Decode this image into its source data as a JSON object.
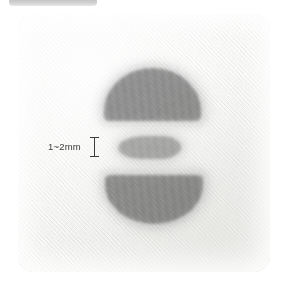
{
  "top_bar": {
    "name": "partial-rounded-bar",
    "color": "#bdbdbd"
  },
  "photo": {
    "name": "fabric-closeup-photo",
    "background_color": "#f7f7f6",
    "material": "white-twill-fabric",
    "corner_radius_px": 16
  },
  "annotation": {
    "label": "1~2mm",
    "marker": "i-beam-caliper",
    "text_color": "#3a3a3a",
    "marker_color": "#3d3d3d"
  },
  "marks": [
    {
      "id": "mark-top",
      "shape": "dome",
      "description": "rounded-top flat-bottom graphite smudge",
      "color": "#7e7e7e"
    },
    {
      "id": "mark-middle",
      "shape": "thin-bar",
      "description": "thin horizontal lighter graphite smudge",
      "color": "#7e7e7e"
    },
    {
      "id": "mark-bottom",
      "shape": "inverted-dome",
      "description": "flat-top rounded-bottom graphite smudge",
      "color": "#7e7e7e"
    }
  ]
}
